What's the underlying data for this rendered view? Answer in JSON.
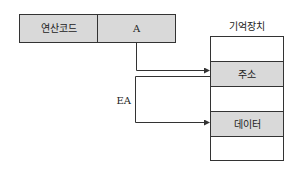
{
  "diagram": {
    "type": "indirect-addressing",
    "instruction": {
      "opcode_label": "연산코드",
      "address_label": "A"
    },
    "memory": {
      "title": "기억장치",
      "cells": [
        {
          "label": "",
          "shaded": false
        },
        {
          "label": "주소",
          "shaded": true
        },
        {
          "label": "",
          "shaded": false
        },
        {
          "label": "데이터",
          "shaded": true
        },
        {
          "label": "",
          "shaded": false
        }
      ]
    },
    "arrows": [
      {
        "from": "A",
        "to": "주소"
      },
      {
        "from": "주소",
        "to": "데이터",
        "label": "EA"
      }
    ],
    "ea_label": "EA",
    "colors": {
      "cell_fill": "#d9d9d9",
      "stroke": "#333333",
      "background": "#ffffff"
    }
  }
}
